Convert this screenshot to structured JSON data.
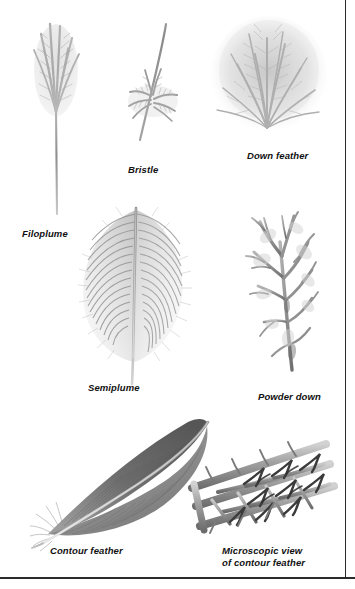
{
  "figure": {
    "background_color": "#ffffff",
    "ink_color": "#111111",
    "border_color": "#2b2b2b"
  },
  "specimens": [
    {
      "id": "filoplume",
      "label": "Filoplume",
      "icon": "filoplume-feather-illustration",
      "description": "Long slender shaft with a small tuft of barbs at the tip"
    },
    {
      "id": "bristle",
      "label": "Bristle",
      "icon": "bristle-feather-illustration",
      "description": "Stiff curved shaft with sparse barbs near the base"
    },
    {
      "id": "down",
      "label": "Down feather",
      "icon": "down-feather-illustration",
      "description": "Dense fluffy plume radiating in all directions"
    },
    {
      "id": "semiplume",
      "label": "Semiplume",
      "icon": "semiplume-feather-illustration",
      "description": "Broad rachis with loose downy vane"
    },
    {
      "id": "powder-down",
      "label": "Powder down",
      "icon": "powder-down-feather-illustration",
      "description": "Branching feather that disintegrates into powder"
    },
    {
      "id": "contour",
      "label": "Contour feather",
      "icon": "contour-feather-illustration",
      "description": "Smooth closed vane with a tapering tip"
    },
    {
      "id": "microscopic",
      "label": "Microscopic view\nof contour feather",
      "icon": "feather-barbule-microscopic-illustration",
      "description": "Barbs, barbules and hooklets interlocking"
    }
  ]
}
